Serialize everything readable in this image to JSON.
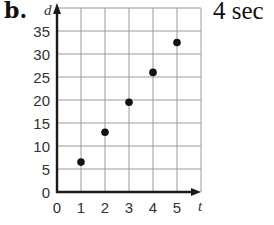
{
  "problem": {
    "part_label": "b.",
    "answer": "4 sec"
  },
  "chart_data": {
    "type": "scatter",
    "title": "",
    "xlabel": "t",
    "ylabel": "d",
    "x_ticks": [
      0,
      1,
      2,
      3,
      4,
      5
    ],
    "y_ticks": [
      0,
      5,
      10,
      15,
      20,
      25,
      30,
      35
    ],
    "xlim": [
      0,
      6
    ],
    "ylim": [
      0,
      40
    ],
    "grid": true,
    "legend": null,
    "series": [
      {
        "name": "points",
        "x": [
          1,
          2,
          3,
          4,
          5
        ],
        "y": [
          6.5,
          13,
          19.5,
          26,
          32.5
        ]
      }
    ],
    "colors": {
      "grid": "#9a9a9a",
      "axis": "#1a1a1a",
      "points": "#111111"
    }
  }
}
